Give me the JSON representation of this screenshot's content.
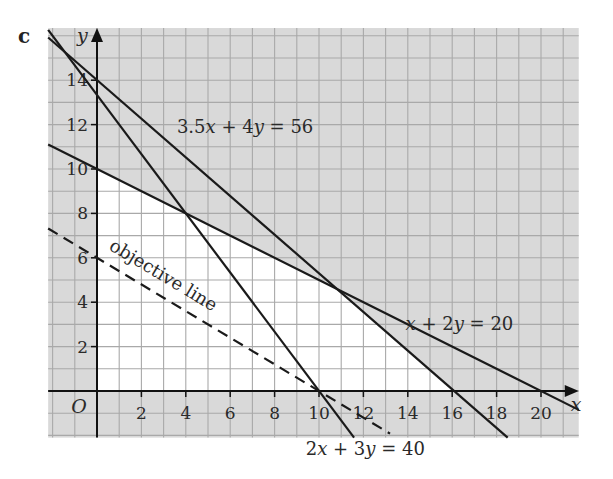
{
  "part_label": "c",
  "chart_data": {
    "type": "line",
    "title": "",
    "xlabel": "x",
    "ylabel": "y",
    "origin_label": "O",
    "xlim": [
      -2.2,
      21.7
    ],
    "ylim": [
      -2.1,
      16.35
    ],
    "grid": true,
    "grid_step": 1,
    "x_ticks": [
      2,
      4,
      6,
      8,
      10,
      12,
      14,
      16,
      18,
      20
    ],
    "y_ticks": [
      2,
      4,
      6,
      8,
      10,
      12,
      14
    ],
    "colors": {
      "shaded": "#d9d9d9",
      "feasible": "#ffffff",
      "grid": "#a9a9a9",
      "line": "#1a1a1a"
    },
    "feasible_region": [
      [
        0,
        0
      ],
      [
        0,
        10
      ],
      [
        10.67,
        4.67
      ],
      [
        16,
        0
      ]
    ],
    "series": [
      {
        "name": "3.5x + 4y = 56",
        "style": "solid",
        "points": [
          [
            -2.2,
            15.925
          ],
          [
            18.5,
            -2.1
          ]
        ],
        "label": "3.5x + 4y = 56",
        "label_pos": [
          3.6,
          11.6
        ]
      },
      {
        "name": "x + 2y = 20",
        "style": "solid",
        "points": [
          [
            -2.2,
            11.1
          ],
          [
            21.7,
            -0.85
          ]
        ],
        "label": "x + 2y = 20",
        "label_pos": [
          13.9,
          2.75
        ]
      },
      {
        "name": "2x + 3y = 40",
        "style": "solid",
        "points": [
          [
            -2.2,
            16.27
          ],
          [
            11.58,
            -2.1
          ]
        ],
        "label": "2x + 3y = 40",
        "label_pos": [
          9.4,
          -2.9
        ]
      },
      {
        "name": "objective line",
        "style": "dashed",
        "points": [
          [
            -2.2,
            7.32
          ],
          [
            13.2,
            -1.92
          ]
        ],
        "label": "objective line",
        "label_pos": [
          0.5,
          6.4
        ],
        "label_angle": 31
      }
    ],
    "intersections": [
      [
        4,
        8
      ],
      [
        10.67,
        4.67
      ],
      [
        10,
        0
      ],
      [
        16,
        0
      ],
      [
        20,
        0
      ]
    ]
  }
}
